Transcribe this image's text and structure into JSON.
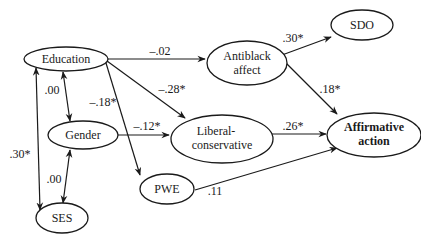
{
  "diagram": {
    "type": "path-diagram",
    "nodes": {
      "education": {
        "label_lines": [
          "Education"
        ]
      },
      "antiblack": {
        "label_lines": [
          "Antiblack",
          "affect"
        ]
      },
      "sdo": {
        "label_lines": [
          "SDO"
        ]
      },
      "gender": {
        "label_lines": [
          "Gender"
        ]
      },
      "libcon": {
        "label_lines": [
          "Liberal-",
          "conservative"
        ]
      },
      "affirm": {
        "label_lines": [
          "Affirmative",
          "action"
        ]
      },
      "pwe": {
        "label_lines": [
          "PWE"
        ]
      },
      "ses": {
        "label_lines": [
          "SES"
        ]
      }
    },
    "edges": [
      {
        "from": "Education",
        "to": "Antiblack affect",
        "coef": "–.02",
        "type": "directed"
      },
      {
        "from": "Education",
        "to": "Liberal-conservative",
        "coef": "–.28*",
        "type": "directed"
      },
      {
        "from": "Education",
        "to": "PWE",
        "coef": "–.18*",
        "type": "directed"
      },
      {
        "from": "Education",
        "to": "Gender",
        "coef": ".00",
        "type": "bidirectional"
      },
      {
        "from": "Education",
        "to": "SES",
        "coef": ".30*",
        "type": "bidirectional"
      },
      {
        "from": "Gender",
        "to": "SES",
        "coef": ".00",
        "type": "bidirectional"
      },
      {
        "from": "Gender",
        "to": "Liberal-conservative",
        "coef": "–.12*",
        "type": "directed"
      },
      {
        "from": "Antiblack affect",
        "to": "SDO",
        "coef": ".30*",
        "type": "directed"
      },
      {
        "from": "Antiblack affect",
        "to": "Affirmative action",
        "coef": ".18*",
        "type": "directed"
      },
      {
        "from": "Liberal-conservative",
        "to": "Affirmative action",
        "coef": ".26*",
        "type": "directed"
      },
      {
        "from": "PWE",
        "to": "Affirmative action",
        "coef": ".11",
        "type": "directed"
      }
    ]
  }
}
